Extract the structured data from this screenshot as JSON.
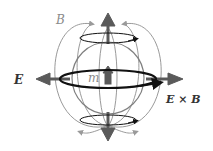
{
  "labels": {
    "B": "B",
    "E": "E",
    "m": "m",
    "ExB": "E × B"
  },
  "colors": {
    "field_lines": "#9a9a9a",
    "sphere": "#808080",
    "arrows": "#5a5a5a",
    "current_loops": "#111111"
  }
}
